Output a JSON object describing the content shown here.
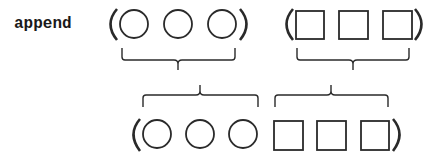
{
  "diagram": {
    "function_label": "append",
    "stroke_color": "#2a2a2a",
    "inputs": [
      {
        "name": "first-list",
        "element_shape": "circle",
        "count": 3
      },
      {
        "name": "second-list",
        "element_shape": "square",
        "count": 3
      }
    ],
    "output": {
      "name": "result-list",
      "elements": [
        "circle",
        "circle",
        "circle",
        "square",
        "square",
        "square"
      ]
    },
    "paren_open": "(",
    "paren_close": ")"
  }
}
